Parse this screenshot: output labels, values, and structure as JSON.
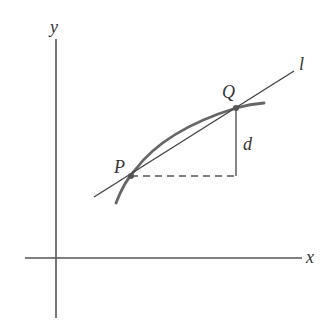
{
  "diagram": {
    "colors": {
      "axis": "#555555",
      "curve": "#666666",
      "line": "#444444",
      "text": "#333333",
      "background": "#ffffff"
    },
    "labels": {
      "x_axis": "x",
      "y_axis": "y",
      "point_p": "P",
      "point_q": "Q",
      "line_l": "l",
      "distance_d": "d"
    },
    "points": {
      "P": [
        131,
        176
      ],
      "Q": [
        236,
        108
      ]
    }
  }
}
